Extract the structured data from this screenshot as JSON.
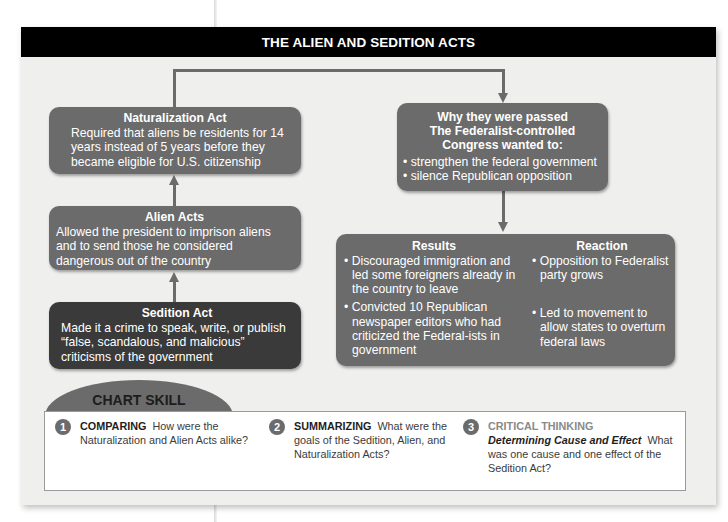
{
  "title": "THE ALIEN AND SEDITION ACTS",
  "colors": {
    "title_bar": "#000000",
    "panel_bg": "#efefee",
    "box_mid": "#6b6b6b",
    "box_dark": "#3a3a3a",
    "connector": "#6b6b6b"
  },
  "left_column": {
    "naturalization": {
      "heading": "Naturalization Act",
      "body": "Required that aliens be residents for 14 years instead of 5 years before they became eligible for U.S. citizenship"
    },
    "alien": {
      "heading": "Alien Acts",
      "body": "Allowed the president to imprison aliens and to send those he considered dangerous out of the country"
    },
    "sedition": {
      "heading": "Sedition Act",
      "body": "Made it a crime to speak, write, or publish “false, scandalous, and malicious” criticisms of the government"
    }
  },
  "why": {
    "heading_line1": "Why they were passed",
    "heading_line2": "The Federalist-controlled Congress wanted to:",
    "items": [
      "strengthen the federal government",
      "silence Republican opposition"
    ]
  },
  "results": {
    "heading": "Results",
    "items": [
      "Discouraged immigration and led some foreigners already in the country to leave",
      "Convicted 10 Republican newspaper editors who had criticized the Federal-ists in government"
    ]
  },
  "reaction": {
    "heading": "Reaction",
    "items": [
      "Opposition to Federalist party grows",
      "Led to movement to allow states to overturn federal laws"
    ]
  },
  "chart_skill": {
    "label": "CHART SKILL",
    "questions": [
      {
        "number": "1",
        "keyword": "COMPARING",
        "text": "How were the Naturalization and Alien Acts alike?"
      },
      {
        "number": "2",
        "keyword": "SUMMARIZING",
        "text": "What were the goals of the Sedition, Alien, and Naturalization Acts?"
      },
      {
        "number": "3",
        "keyword": "CRITICAL THINKING",
        "subkeyword": "Determining Cause and Effect",
        "text": "What was one cause and one effect of the Sedition Act?"
      }
    ]
  }
}
